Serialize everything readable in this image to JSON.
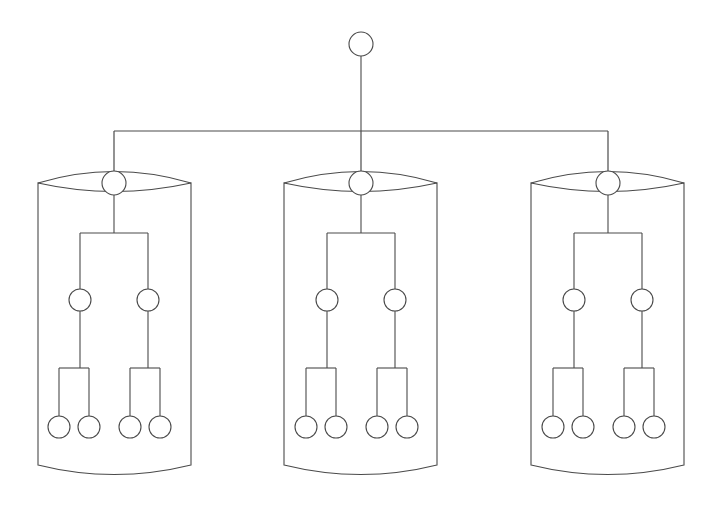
{
  "diagram": {
    "title": "Distributed binary tree replicated across three storage cylinders",
    "type": "node-link-diagram",
    "background_color": "#ffffff",
    "stroke_color": "#4a4a4a",
    "node_fill_color": "#ffffff",
    "stroke_width": 1.1,
    "canvas": {
      "width": 723,
      "height": 518
    }
  },
  "root": {
    "name": "root-node",
    "shape": "circle",
    "cx": 361,
    "cy": 44,
    "r": 12,
    "stem": {
      "x": 361,
      "y_top": 56,
      "y_bottom": 131
    }
  },
  "bus": {
    "name": "horizontal-distribution-bus",
    "y": 131,
    "x_left": 114,
    "x_right": 608,
    "drops": [
      {
        "x": 114,
        "y_top": 131,
        "y_bottom": 183
      },
      {
        "x": 361,
        "y_top": 131,
        "y_bottom": 183
      },
      {
        "x": 608,
        "y_top": 131,
        "y_bottom": 183
      }
    ]
  },
  "cylinder_geometry": {
    "width": 153,
    "top_y": 183,
    "bottom_y": 465,
    "lens_apex_y": 160,
    "lens_bottom_y": 200,
    "base_arc_depth_y": 484
  },
  "tree_geometry": {
    "root_cy": 183,
    "root_r": 12,
    "root_stem_bottom": 233,
    "level1_bar_y": 233,
    "level1_offset": 34,
    "mid_cy": 300,
    "mid_r": 11,
    "leaf_bar_y": 368,
    "leaf_cy": 427,
    "leaf_r": 11,
    "leaf_inner_offset": 15,
    "leaf_outer_offset": 15
  },
  "cylinders": [
    {
      "id": "cylinder-1",
      "label": "Storage Cylinder 1",
      "x_left": 38,
      "x_right": 191,
      "center_x": 114,
      "nodes": {
        "root": {
          "label": "C1 Root",
          "cx": 114,
          "cy": 183
        },
        "mid": [
          {
            "label": "C1 Mid Left",
            "cx": 80,
            "cy": 300
          },
          {
            "label": "C1 Mid Right",
            "cx": 148,
            "cy": 300
          }
        ],
        "leaves": [
          {
            "label": "C1 Leaf 1",
            "cx": 59,
            "cy": 427
          },
          {
            "label": "C1 Leaf 2",
            "cx": 89,
            "cy": 427
          },
          {
            "label": "C1 Leaf 3",
            "cx": 130,
            "cy": 427
          },
          {
            "label": "C1 Leaf 4",
            "cx": 160,
            "cy": 427
          }
        ]
      }
    },
    {
      "id": "cylinder-2",
      "label": "Storage Cylinder 2",
      "x_left": 284,
      "x_right": 437,
      "center_x": 361,
      "nodes": {
        "root": {
          "label": "C2 Root",
          "cx": 361,
          "cy": 183
        },
        "mid": [
          {
            "label": "C2 Mid Left",
            "cx": 327,
            "cy": 300
          },
          {
            "label": "C2 Mid Right",
            "cx": 395,
            "cy": 300
          }
        ],
        "leaves": [
          {
            "label": "C2 Leaf 1",
            "cx": 306,
            "cy": 427
          },
          {
            "label": "C2 Leaf 2",
            "cx": 336,
            "cy": 427
          },
          {
            "label": "C2 Leaf 3",
            "cx": 377,
            "cy": 427
          },
          {
            "label": "C2 Leaf 4",
            "cx": 407,
            "cy": 427
          }
        ]
      }
    },
    {
      "id": "cylinder-3",
      "label": "Storage Cylinder 3",
      "x_left": 531,
      "x_right": 684,
      "center_x": 608,
      "nodes": {
        "root": {
          "label": "C3 Root",
          "cx": 608,
          "cy": 183
        },
        "mid": [
          {
            "label": "C3 Mid Left",
            "cx": 574,
            "cy": 300
          },
          {
            "label": "C3 Mid Right",
            "cx": 642,
            "cy": 300
          }
        ],
        "leaves": [
          {
            "label": "C3 Leaf 1",
            "cx": 553,
            "cy": 427
          },
          {
            "label": "C3 Leaf 2",
            "cx": 583,
            "cy": 427
          },
          {
            "label": "C3 Leaf 3",
            "cx": 624,
            "cy": 427
          },
          {
            "label": "C3 Leaf 4",
            "cx": 654,
            "cy": 427
          }
        ]
      }
    }
  ]
}
